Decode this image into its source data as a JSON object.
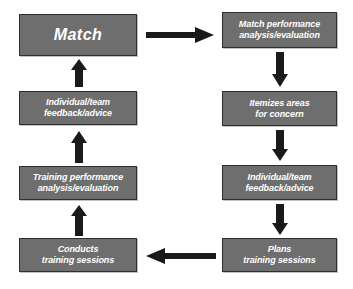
{
  "diagram": {
    "type": "flowchart",
    "colors": {
      "node_fill": "#6e6e6e",
      "node_border": "#2f2f2f",
      "node_text": "#ffffff",
      "arrow": "#1a1a1a",
      "background": "#ffffff"
    },
    "nodes": [
      {
        "id": "match",
        "label": "Match"
      },
      {
        "id": "match-performance",
        "label": "Match performance\nanalysis/evaluation"
      },
      {
        "id": "itemizes-areas",
        "label": "Itemizes areas\nfor concern"
      },
      {
        "id": "feedback-right",
        "label": "Individual/team\nfeedback/advice"
      },
      {
        "id": "plans-training",
        "label": "Plans\ntraining sessions"
      },
      {
        "id": "conducts-training",
        "label": "Conducts\ntraining sessions"
      },
      {
        "id": "training-performance",
        "label": "Training performance\nanalysis/evaluation"
      },
      {
        "id": "feedback-left",
        "label": "Individual/team\nfeedback/advice"
      }
    ],
    "arrows": [
      {
        "id": "match-to-match-performance",
        "direction": "right",
        "from": "match",
        "to": "match-performance"
      },
      {
        "id": "match-performance-to-itemizes",
        "direction": "down",
        "from": "match-performance",
        "to": "itemizes-areas"
      },
      {
        "id": "itemizes-to-feedback-right",
        "direction": "down",
        "from": "itemizes-areas",
        "to": "feedback-right"
      },
      {
        "id": "feedback-right-to-plans",
        "direction": "down",
        "from": "feedback-right",
        "to": "plans-training"
      },
      {
        "id": "plans-to-conducts",
        "direction": "left",
        "from": "plans-training",
        "to": "conducts-training"
      },
      {
        "id": "conducts-to-training-performance",
        "direction": "up",
        "from": "conducts-training",
        "to": "training-performance"
      },
      {
        "id": "training-performance-to-feedback-left",
        "direction": "up",
        "from": "training-performance",
        "to": "feedback-left"
      },
      {
        "id": "feedback-left-to-match",
        "direction": "up",
        "from": "feedback-left",
        "to": "match"
      }
    ]
  }
}
